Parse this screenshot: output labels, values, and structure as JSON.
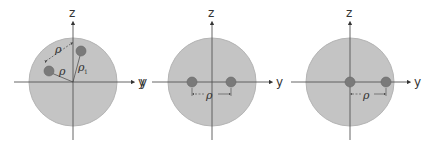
{
  "colors": {
    "disk_fill": "#c4c4c4",
    "disk_stroke": "#b0b0b0",
    "axis": "#555555",
    "particle": "#7a7a7a",
    "particle_stroke": "#666666",
    "dim_line": "#444444",
    "text": "#333333"
  },
  "panels": [
    {
      "id": "panel-1",
      "axes": {
        "vertical_label": "z",
        "horizontal_label": "y"
      },
      "dimension_labels": {
        "separation": "ρ",
        "radius_a": "ρ",
        "radius_b": "ρ",
        "radius_b_subscript": "1"
      }
    },
    {
      "id": "panel-2",
      "axes": {
        "vertical_label": "z",
        "horizontal_label": "y",
        "left_label": "y"
      },
      "dimension_labels": {
        "separation": "ρ"
      }
    },
    {
      "id": "panel-3",
      "axes": {
        "vertical_label": "z",
        "horizontal_label": "y"
      },
      "dimension_labels": {
        "separation": "ρ"
      }
    }
  ]
}
